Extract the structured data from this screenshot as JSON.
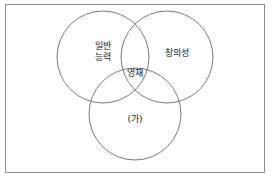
{
  "figure": {
    "type": "venn-diagram-3-set",
    "background_color": "#ffffff",
    "frame_color": "#8d8d8d",
    "circle_stroke_color": "#7a7a7a",
    "text_color": "#1d1d1d",
    "sets": [
      {
        "id": "general-ability",
        "label": "일반\n능력",
        "position": "top-left"
      },
      {
        "id": "creativity",
        "label": "창의성",
        "position": "top-right"
      },
      {
        "id": "unknown-factor",
        "label": "(가)",
        "position": "bottom-center"
      }
    ],
    "intersection": {
      "id": "giftedness",
      "label": "영재"
    }
  }
}
